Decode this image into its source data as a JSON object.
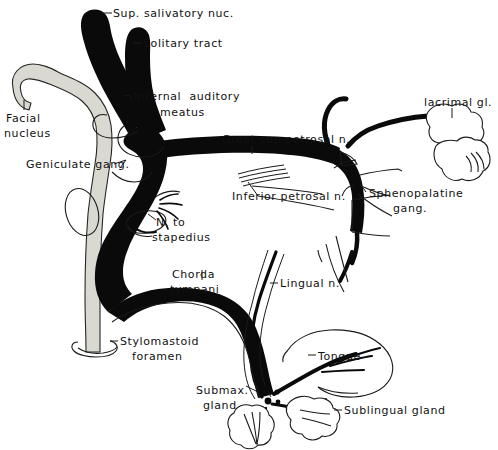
{
  "figure": {
    "style": "black-and-white line drawing",
    "background_color": "#ffffff",
    "ink_color": "#0a0a0a",
    "gray_tract_color": "#d9d9d2"
  },
  "labels": {
    "sup_salivatory_nuc": "Sup. salivatory nuc.",
    "solitary_tract": "Solitary tract",
    "internal_auditory_meatus_line1": "Internal  auditory",
    "internal_auditory_meatus_line2": "meatus",
    "facial_nucleus_line1": "Facial",
    "facial_nucleus_line2": "nucleus",
    "geniculate_gang": "Geniculate gang.",
    "great_sup_petrosal_n": "Great sup.petrosal n.",
    "inferior_petrosal_n": "Inferior petrosal n.",
    "lacrimal_gl": "lacrimal gl.",
    "sphenopalatine_gang_line1": "Sphenopalatine",
    "sphenopalatine_gang_line2": "gang.",
    "n_to_stapedius_line1": "N. to",
    "n_to_stapedius_line2": "stapedius",
    "chorda_tympani_line1": "Chorda",
    "chorda_tympani_line2": "tympani",
    "lingual_n": "Lingual n.",
    "stylomastoid_foramen_line1": "Stylomastoid",
    "stylomastoid_foramen_line2": "foramen",
    "tongue": "Tongue",
    "submax_gland_line1": "Submax.",
    "submax_gland_line2": "gland",
    "sublingual_gland": "Sublingual gland"
  },
  "structures": [
    {
      "name": "superior-salivatory-nucleus",
      "kind": "black-tract"
    },
    {
      "name": "solitary-tract",
      "kind": "black-tract"
    },
    {
      "name": "facial-nucleus",
      "kind": "gray-lobe"
    },
    {
      "name": "internal-auditory-meatus",
      "kind": "outline-marker"
    },
    {
      "name": "geniculate-ganglion",
      "kind": "junction"
    },
    {
      "name": "great-superficial-petrosal-nerve",
      "kind": "black-tract"
    },
    {
      "name": "inferior-petrosal-nerve",
      "kind": "thin-fibers"
    },
    {
      "name": "sphenopalatine-ganglion",
      "kind": "outline"
    },
    {
      "name": "lacrimal-gland",
      "kind": "lobed-outline"
    },
    {
      "name": "nerve-to-stapedius",
      "kind": "small-loop"
    },
    {
      "name": "chorda-tympani",
      "kind": "black-tract"
    },
    {
      "name": "lingual-nerve",
      "kind": "black-tract"
    },
    {
      "name": "stylomastoid-foramen",
      "kind": "ring-marker"
    },
    {
      "name": "tongue",
      "kind": "outline"
    },
    {
      "name": "submaxillary-gland",
      "kind": "lobed-outline"
    },
    {
      "name": "sublingual-gland",
      "kind": "lobed-outline"
    }
  ]
}
